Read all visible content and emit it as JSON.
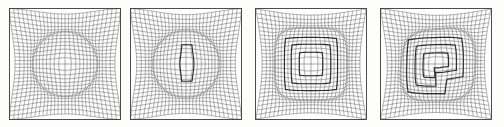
{
  "figure": {
    "caption": "",
    "background_color": "#fdfdfc",
    "mesh_color": "#4a4a4a",
    "patch_color": "#2e2e2e",
    "panel_count": 4,
    "panel_width_px": 112,
    "panel_height_px": 112,
    "panel_top_px": 8,
    "panel_left_positions_px": [
      9,
      130,
      255,
      380
    ]
  },
  "chart_data": {
    "type": "diagram",
    "xlabel": "",
    "ylabel": "",
    "grid": true,
    "legend": "none",
    "panels": [
      {
        "id": "panel-1",
        "index": 1,
        "label": "",
        "base_grid_nx": 28,
        "base_grid_ny": 28,
        "blob_center_x": 0.5,
        "blob_center_y": 0.5,
        "blob_radius": 0.285,
        "blob_shape": "circle",
        "refinement_levels": 0,
        "patches": [],
        "compression_strength": 0.52,
        "interface_darkening": 0.85
      },
      {
        "id": "panel-2",
        "index": 2,
        "label": "",
        "base_grid_nx": 28,
        "base_grid_ny": 28,
        "blob_center_x": 0.5,
        "blob_center_y": 0.5,
        "blob_radius": 0.295,
        "blob_shape": "circle",
        "refinement_levels": 1,
        "patches": [
          {
            "x0": 0.468,
            "y0": 0.355,
            "x1": 0.545,
            "y1": 0.625,
            "type": "rect"
          }
        ],
        "compression_strength": 0.58,
        "interface_darkening": 0.9
      },
      {
        "id": "panel-3",
        "index": 3,
        "label": "",
        "base_grid_nx": 28,
        "base_grid_ny": 28,
        "blob_center_x": 0.5,
        "blob_center_y": 0.5,
        "blob_radius": 0.3,
        "blob_shape": "rounded-square",
        "refinement_levels": 3,
        "patches": [
          {
            "x0": 0.285,
            "y0": 0.285,
            "x1": 0.715,
            "y1": 0.715,
            "type": "rect"
          },
          {
            "x0": 0.355,
            "y0": 0.355,
            "x1": 0.645,
            "y1": 0.645,
            "type": "rect"
          },
          {
            "x0": 0.428,
            "y0": 0.428,
            "x1": 0.572,
            "y1": 0.572,
            "type": "rect"
          }
        ],
        "compression_strength": 0.6,
        "interface_darkening": 0.92
      },
      {
        "id": "panel-4",
        "index": 4,
        "label": "",
        "base_grid_nx": 28,
        "base_grid_ny": 28,
        "blob_center_x": 0.505,
        "blob_center_y": 0.5,
        "blob_radius": 0.315,
        "blob_shape": "deformed-blob",
        "refinement_levels": 3,
        "patches": [
          {
            "type": "path",
            "points": [
              [
                0.255,
                0.285
              ],
              [
                0.715,
                0.285
              ],
              [
                0.715,
                0.6
              ],
              [
                0.575,
                0.6
              ],
              [
                0.575,
                0.745
              ],
              [
                0.255,
                0.745
              ]
            ]
          },
          {
            "type": "path",
            "points": [
              [
                0.345,
                0.36
              ],
              [
                0.645,
                0.36
              ],
              [
                0.645,
                0.545
              ],
              [
                0.5,
                0.545
              ],
              [
                0.5,
                0.665
              ],
              [
                0.345,
                0.665
              ]
            ]
          },
          {
            "type": "path",
            "points": [
              [
                0.42,
                0.435
              ],
              [
                0.575,
                0.435
              ],
              [
                0.575,
                0.515
              ],
              [
                0.495,
                0.515
              ],
              [
                0.495,
                0.585
              ],
              [
                0.42,
                0.585
              ]
            ]
          }
        ],
        "compression_strength": 0.64,
        "interface_darkening": 0.94
      }
    ]
  }
}
